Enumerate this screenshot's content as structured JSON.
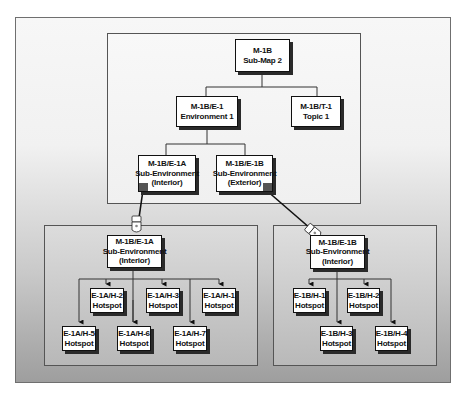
{
  "diagram": {
    "top_map": {
      "root": {
        "line1": "M-1B",
        "line2": "Sub-Map 2"
      },
      "environment": {
        "line1": "M-1B/E-1",
        "line2": "Environment 1"
      },
      "topic": {
        "line1": "M-1B/T-1",
        "line2": "Topic 1"
      },
      "sub_env_a": {
        "line1": "M-1B/E-1A",
        "line2": "Sub-Environment",
        "line3": "(Interior)"
      },
      "sub_env_b": {
        "line1": "M-1B/E-1B",
        "line2": "Sub-Environment",
        "line3": "(Exterior)"
      }
    },
    "left_map": {
      "header": {
        "line1": "M-1B/E-1A",
        "line2": "Sub-Environment",
        "line3": "(Interior)"
      },
      "hotspots": [
        {
          "id": "E-1A/H-2",
          "label": "Hotspot"
        },
        {
          "id": "E-1A/H-3",
          "label": "Hotspot"
        },
        {
          "id": "E-1A/H-1",
          "label": "Hotspot"
        },
        {
          "id": "E-1A/H-5",
          "label": "Hotspot"
        },
        {
          "id": "E-1A/H-6",
          "label": "Hotspot"
        },
        {
          "id": "E-1A/H-7",
          "label": "Hotspot"
        }
      ]
    },
    "right_map": {
      "header": {
        "line1": "M-1B/E-1B",
        "line2": "Sub-Environment",
        "line3": "(Interior)"
      },
      "hotspots": [
        {
          "id": "E-1B/H-1",
          "label": "Hotspot"
        },
        {
          "id": "E-1B/H-2",
          "label": "Hotspot"
        },
        {
          "id": "E-1B/H-3",
          "label": "Hotspot"
        },
        {
          "id": "E-1B/H-4",
          "label": "Hotspot"
        }
      ]
    },
    "icons": [
      "hand-pointer-icon",
      "hand-pointer-icon"
    ]
  }
}
